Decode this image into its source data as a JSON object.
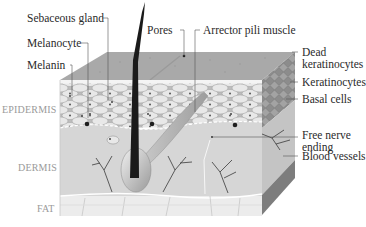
{
  "diagram": {
    "layers": [
      {
        "id": "epidermis",
        "label": "EPIDERMIS"
      },
      {
        "id": "dermis",
        "label": "DERMIS"
      },
      {
        "id": "fat",
        "label": "FAT"
      }
    ],
    "labels_left": [
      {
        "id": "sebaceous-gland",
        "text": "Sebaceous gland"
      },
      {
        "id": "melanocyte",
        "text": "Melanocyte"
      },
      {
        "id": "melanin",
        "text": "Melanin"
      }
    ],
    "labels_top": [
      {
        "id": "pores",
        "text": "Pores"
      },
      {
        "id": "arrector-pili-muscle",
        "text": "Arrector pili muscle"
      }
    ],
    "labels_right": [
      {
        "id": "dead-keratinocytes",
        "line1": "Dead",
        "line2": "keratinocytes"
      },
      {
        "id": "keratinocytes",
        "text": "Keratinocytes"
      },
      {
        "id": "basal-cells",
        "text": "Basal cells"
      },
      {
        "id": "free-nerve-ending",
        "line1": "Free nerve",
        "line2": "ending"
      },
      {
        "id": "blood-vessels",
        "text": "Blood vessels"
      }
    ],
    "colors": {
      "top_surface": "#a9a9a9",
      "epidermis": "#b8b8b8",
      "cell": "#e6e6e6",
      "dermis": "#d6d6d6",
      "fat": "#ececec",
      "side": "#8f8f8f",
      "hair": "#1a1a1a",
      "leader": "#555555",
      "label_text": "#2a2a2a",
      "layer_text": "#9a9a9a"
    }
  }
}
